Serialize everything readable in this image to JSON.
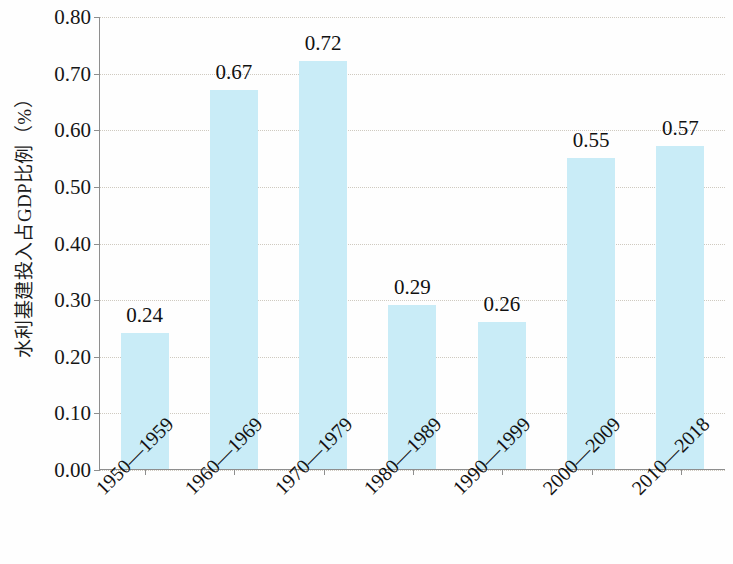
{
  "chart_data": {
    "type": "bar",
    "title": "",
    "subtitle": "",
    "xlabel": "",
    "ylabel": "水利基建投入占GDP比例（%）",
    "categories": [
      "1950—1959",
      "1960—1969",
      "1970—1979",
      "1980—1989",
      "1990—1999",
      "2000—2009",
      "2010—2018"
    ],
    "values": [
      0.24,
      0.67,
      0.72,
      0.29,
      0.26,
      0.55,
      0.57
    ],
    "value_labels": [
      "0.24",
      "0.67",
      "0.72",
      "0.29",
      "0.26",
      "0.55",
      "0.57"
    ],
    "ylim": [
      0.0,
      0.8
    ],
    "ytick_step": 0.1,
    "ytick_labels": [
      "0.00",
      "0.10",
      "0.20",
      "0.30",
      "0.40",
      "0.50",
      "0.60",
      "0.70",
      "0.80"
    ],
    "ytick_values": [
      0.0,
      0.1,
      0.2,
      0.3,
      0.4,
      0.5,
      0.6,
      0.7,
      0.8
    ],
    "grid": "horizontal-dotted",
    "legend": null,
    "legend_position": "none",
    "series": [
      {
        "name": "水利基建投入占GDP比例",
        "values": [
          0.24,
          0.67,
          0.72,
          0.29,
          0.26,
          0.55,
          0.57
        ]
      }
    ],
    "colors": {
      "bar": "#c9ecf7",
      "axis": "#8e8e8e",
      "grid": "#cfcac0",
      "text": "#131313",
      "background": "#fefefe"
    }
  }
}
